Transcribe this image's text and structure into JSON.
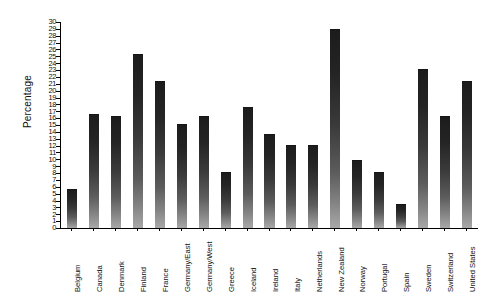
{
  "chart_data": {
    "type": "bar",
    "title": "",
    "subtitle": "",
    "xlabel": "",
    "ylabel": "Percentage",
    "ylim": [
      0,
      30
    ],
    "ytick_step": 1,
    "grid": false,
    "legend": false,
    "legend_position": "none",
    "bar_style": "vertical-gradient-dark-to-light",
    "categories": [
      "Belgium",
      "Canada",
      "Denmark",
      "Finland",
      "France",
      "Germany/East",
      "Germany/West",
      "Greece",
      "Iceland",
      "Ireland",
      "Italy",
      "Netherlands",
      "New Zealand",
      "Norway",
      "Portugal",
      "Spain",
      "Sweden",
      "Switzerland",
      "United States"
    ],
    "values": [
      5.5,
      16.5,
      16.2,
      25.2,
      21.2,
      15.0,
      16.2,
      8.0,
      17.5,
      13.5,
      12.0,
      12.0,
      28.8,
      9.8,
      8.0,
      3.3,
      23.0,
      16.2,
      21.3
    ],
    "yticks": [
      "0",
      "1",
      "2",
      "3",
      "4",
      "5",
      "6",
      "7",
      "8",
      "9",
      "10",
      "11",
      "12",
      "13",
      "14",
      "15",
      "16",
      "17",
      "18",
      "19",
      "20",
      "21",
      "22",
      "23",
      "24",
      "25",
      "26",
      "27",
      "28",
      "29",
      "30"
    ],
    "colors": {
      "bar_top": "#1c1c1c",
      "bar_bottom": "#a8a8a8",
      "axis": "#000000",
      "text": "#101010",
      "background": "#ffffff"
    }
  }
}
